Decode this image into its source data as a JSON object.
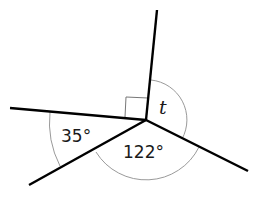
{
  "diagram": {
    "type": "angles-at-a-point",
    "center": [
      146,
      120
    ],
    "rays": [
      {
        "name": "ray-up",
        "end": [
          157,
          10
        ]
      },
      {
        "name": "ray-left",
        "end": [
          10,
          108
        ]
      },
      {
        "name": "ray-lower-left",
        "end": [
          29,
          185
        ]
      },
      {
        "name": "ray-lower-right",
        "end": [
          248,
          171
        ]
      }
    ],
    "angles": [
      {
        "name": "right-angle",
        "between": [
          "ray-left",
          "ray-up"
        ],
        "marker": "square",
        "label": ""
      },
      {
        "name": "angle-t",
        "between": [
          "ray-up",
          "ray-lower-right"
        ],
        "label": "t"
      },
      {
        "name": "angle-122",
        "between": [
          "ray-lower-right",
          "ray-lower-left"
        ],
        "label": "122°"
      },
      {
        "name": "angle-35",
        "between": [
          "ray-lower-left",
          "ray-left"
        ],
        "label": "35°"
      }
    ]
  }
}
